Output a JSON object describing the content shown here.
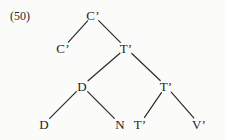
{
  "figure": {
    "example_number": "(50)",
    "kind": "syntax-tree",
    "background_color": "#fbfbf9",
    "text_color": "#1f1f1f",
    "line_color": "#2b2b2b"
  },
  "tree": {
    "nodes": [
      {
        "id": "c-bar-root",
        "label": "C’",
        "x": 93,
        "y": 15
      },
      {
        "id": "c-bar-left",
        "label": "C’",
        "x": 63,
        "y": 48
      },
      {
        "id": "t-bar-1",
        "label": "T’",
        "x": 126,
        "y": 48
      },
      {
        "id": "d-mid",
        "label": "D",
        "x": 82,
        "y": 86
      },
      {
        "id": "t-bar-2",
        "label": "T’",
        "x": 166,
        "y": 86
      },
      {
        "id": "d-leaf",
        "label": "D",
        "x": 44,
        "y": 124
      },
      {
        "id": "n-leaf",
        "label": "N",
        "x": 120,
        "y": 124
      },
      {
        "id": "t-bar-leaf",
        "label": "T’",
        "x": 140,
        "y": 124
      },
      {
        "id": "v-bar-leaf",
        "label": "V’",
        "x": 199,
        "y": 124
      }
    ],
    "edges": [
      {
        "id": "edge-root-to-c-bar-left",
        "from": "c-bar-root",
        "to": "c-bar-left"
      },
      {
        "id": "edge-root-to-t-bar-1",
        "from": "c-bar-root",
        "to": "t-bar-1"
      },
      {
        "id": "edge-t1-to-d-mid",
        "from": "t-bar-1",
        "to": "d-mid"
      },
      {
        "id": "edge-t1-to-t-bar-2",
        "from": "t-bar-1",
        "to": "t-bar-2"
      },
      {
        "id": "edge-d-mid-to-d-leaf",
        "from": "d-mid",
        "to": "d-leaf"
      },
      {
        "id": "edge-d-mid-to-n-leaf",
        "from": "d-mid",
        "to": "n-leaf"
      },
      {
        "id": "edge-t2-to-t-bar-leaf",
        "from": "t-bar-2",
        "to": "t-bar-leaf"
      },
      {
        "id": "edge-t2-to-v-bar-leaf",
        "from": "t-bar-2",
        "to": "v-bar-leaf"
      }
    ]
  }
}
